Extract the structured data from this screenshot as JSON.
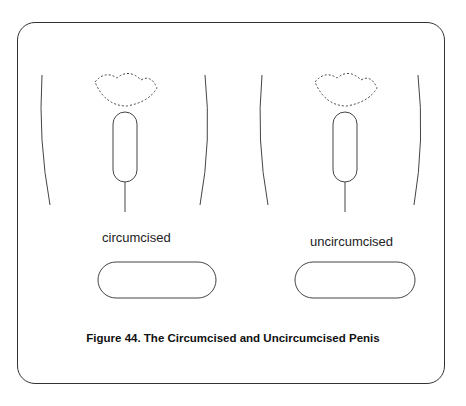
{
  "figure": {
    "caption": "Figure 44. The Circumcised and Uncircumcised Penis",
    "panels": [
      {
        "label": "circumcised"
      },
      {
        "label": "uncircumcised"
      }
    ]
  },
  "colors": {
    "line": "#333333",
    "background": "#ffffff"
  }
}
